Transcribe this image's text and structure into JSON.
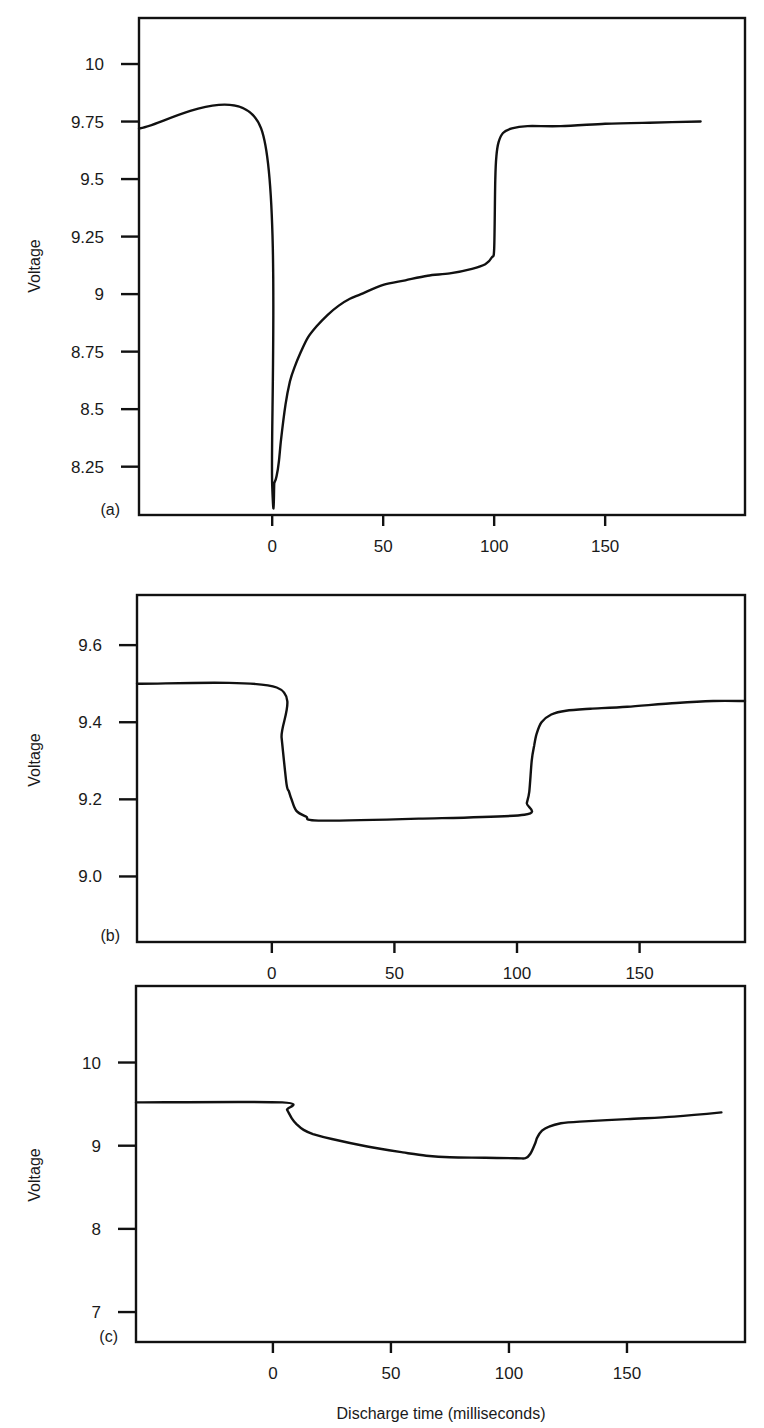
{
  "chart_data": [
    {
      "type": "line",
      "panel_label": "(a)",
      "title": "",
      "xlabel": "",
      "ylabel": "Voltage",
      "xlim": [
        -60,
        213
      ],
      "ylim": [
        8.04,
        10.2
      ],
      "xticks": [
        0,
        50,
        100,
        150
      ],
      "xtick_labels": [
        "0",
        "50",
        "100",
        "150"
      ],
      "yticks": [
        10,
        9.75,
        9.5,
        9.25,
        9,
        8.75,
        8.5,
        8.25
      ],
      "ytick_labels": [
        "10",
        "9.75",
        "9.5",
        "9.25",
        "9",
        "8.75",
        "8.5",
        "8.25"
      ],
      "grid": false,
      "series": [
        {
          "name": "voltage",
          "x": [
            -60,
            -5,
            0,
            1,
            2,
            3,
            4,
            6,
            8,
            10,
            13,
            16,
            20,
            25,
            30,
            35,
            40,
            50,
            60,
            70,
            80,
            90,
            96,
            99,
            100,
            100.5,
            101,
            102,
            104,
            108,
            115,
            130,
            150,
            170,
            193
          ],
          "y": [
            9.72,
            9.72,
            8.17,
            8.18,
            8.21,
            8.27,
            8.37,
            8.52,
            8.62,
            8.68,
            8.75,
            8.81,
            8.86,
            8.91,
            8.95,
            8.98,
            9.0,
            9.04,
            9.06,
            9.08,
            9.09,
            9.11,
            9.13,
            9.16,
            9.2,
            9.5,
            9.6,
            9.66,
            9.7,
            9.72,
            9.73,
            9.73,
            9.74,
            9.745,
            9.75
          ]
        }
      ]
    },
    {
      "type": "line",
      "panel_label": "(b)",
      "title": "",
      "xlabel": "",
      "ylabel": "Voltage",
      "xlim": [
        -55,
        193
      ],
      "ylim": [
        8.83,
        9.73
      ],
      "xticks": [
        0,
        50,
        100,
        150
      ],
      "xtick_labels": [
        "0",
        "50",
        "100",
        "150"
      ],
      "yticks": [
        9.6,
        9.4,
        9.2,
        9.0
      ],
      "ytick_labels": [
        "9.6",
        "9.4",
        "9.2",
        "9.0"
      ],
      "grid": false,
      "series": [
        {
          "name": "voltage",
          "x": [
            -55,
            2,
            4,
            6,
            7,
            8,
            10,
            14,
            19,
            60,
            103,
            104,
            105,
            106,
            107,
            108,
            110,
            114,
            120,
            130,
            145,
            165,
            180,
            193
          ],
          "y": [
            9.5,
            9.49,
            9.36,
            9.24,
            9.22,
            9.2,
            9.17,
            9.155,
            9.145,
            9.15,
            9.16,
            9.19,
            9.22,
            9.3,
            9.34,
            9.37,
            9.4,
            9.42,
            9.43,
            9.435,
            9.44,
            9.45,
            9.455,
            9.455
          ]
        }
      ]
    },
    {
      "type": "line",
      "panel_label": "(c)",
      "title": "",
      "xlabel": "Discharge time (milliseconds)",
      "ylabel": "Voltage",
      "xlim": [
        -58,
        200
      ],
      "ylim": [
        6.64,
        10.92
      ],
      "xticks": [
        0,
        50,
        100,
        150
      ],
      "xtick_labels": [
        "0",
        "50",
        "100",
        "150"
      ],
      "yticks": [
        10,
        9,
        8,
        7
      ],
      "ytick_labels": [
        "10",
        "9",
        "8",
        "7"
      ],
      "grid": false,
      "series": [
        {
          "name": "voltage",
          "x": [
            -58,
            4,
            6,
            8,
            10,
            13,
            17,
            25,
            40,
            55,
            65,
            75,
            90,
            103,
            107,
            109,
            111,
            112,
            114,
            117,
            122,
            130,
            150,
            170,
            190
          ],
          "y": [
            9.52,
            9.52,
            9.43,
            9.33,
            9.26,
            9.19,
            9.14,
            9.08,
            8.99,
            8.92,
            8.88,
            8.86,
            8.855,
            8.85,
            8.85,
            8.9,
            9.02,
            9.1,
            9.18,
            9.23,
            9.27,
            9.29,
            9.32,
            9.35,
            9.4
          ]
        }
      ]
    }
  ]
}
